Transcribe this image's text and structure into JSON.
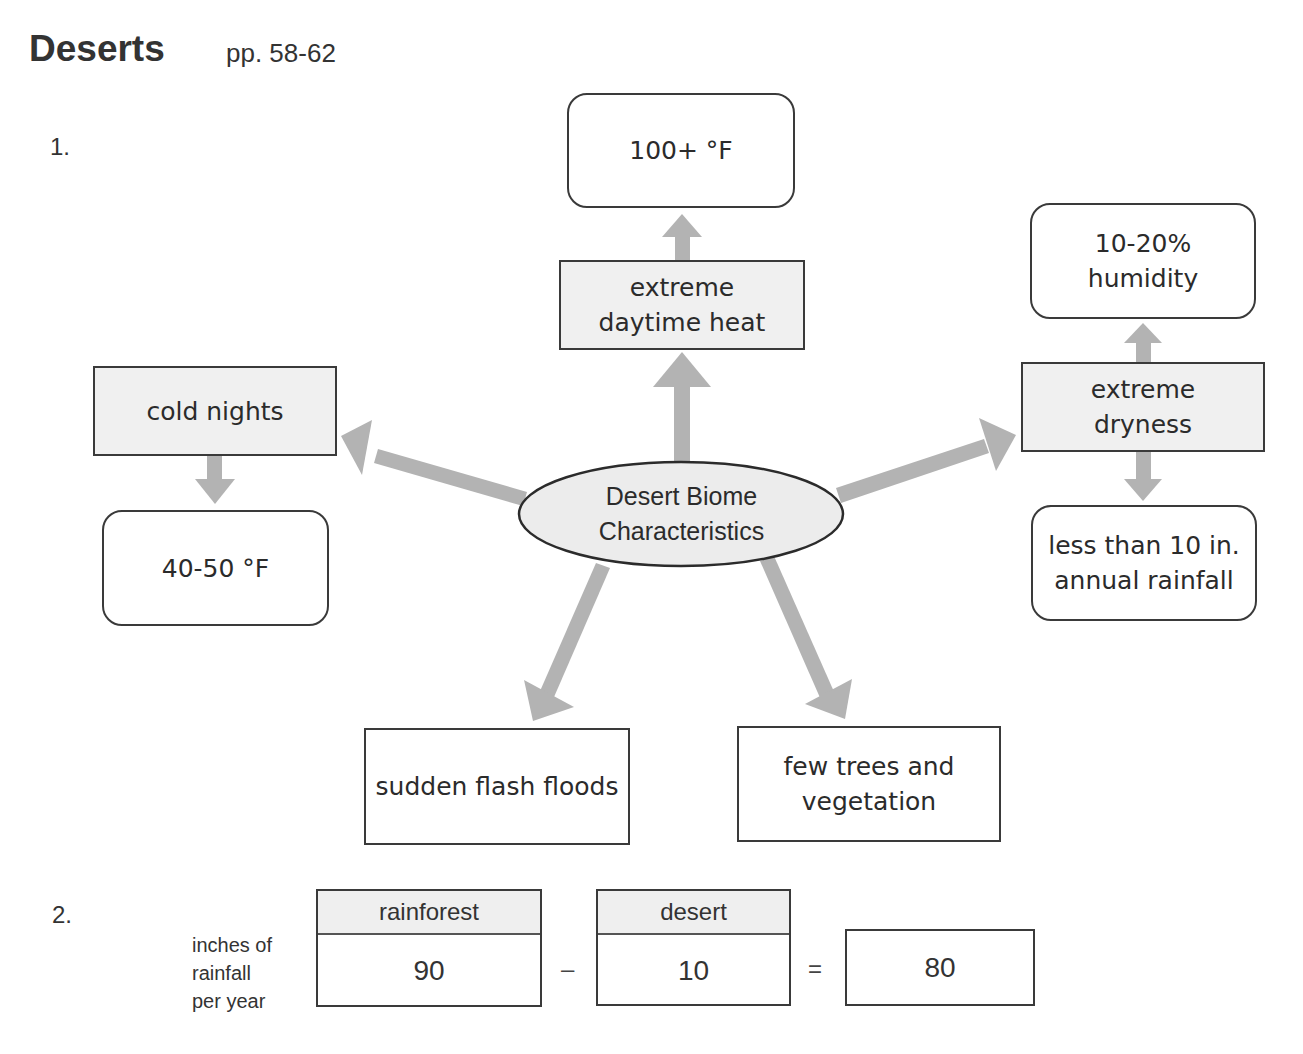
{
  "header": {
    "title": "Deserts",
    "pages": "pp. 58-62"
  },
  "question1": {
    "number": "1.",
    "center": {
      "line1": "Desert Biome",
      "line2": "Characteristics"
    },
    "branches": {
      "heat": {
        "label_line1": "extreme",
        "label_line2": "daytime heat",
        "detail": "100+ °F"
      },
      "dryness": {
        "label_line1": "extreme",
        "label_line2": "dryness",
        "detail_top_line1": "10-20%",
        "detail_top_line2": "humidity",
        "detail_bottom_line1": "less than 10 in.",
        "detail_bottom_line2": "annual rainfall"
      },
      "cold": {
        "label": "cold nights",
        "detail": "40-50 °F"
      },
      "floods": {
        "label": "sudden flash floods"
      },
      "vegetation": {
        "label_line1": "few trees and",
        "label_line2": "vegetation"
      }
    },
    "colors": {
      "arrow": "#b3b3b3",
      "ellipse_fill": "#ececec",
      "shaded_box": "#f0f0f0",
      "border": "#3a3a3a"
    }
  },
  "question2": {
    "number": "2.",
    "side_label_line1": "inches of",
    "side_label_line2": "rainfall",
    "side_label_line3": "per year",
    "rainforest": {
      "header": "rainforest",
      "value": "90"
    },
    "minus": "–",
    "desert": {
      "header": "desert",
      "value": "10"
    },
    "equals": "=",
    "result": "80"
  }
}
